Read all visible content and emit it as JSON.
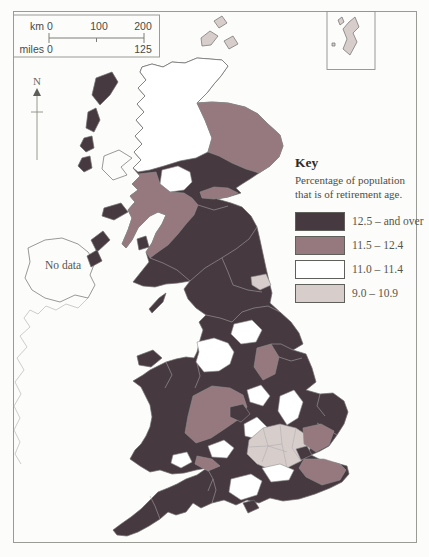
{
  "scale_bar": {
    "km_label": "km",
    "miles_label": "miles",
    "km_ticks": [
      "0",
      "100",
      "200"
    ],
    "miles_ticks": [
      "0",
      "125"
    ]
  },
  "north_arrow": {
    "label": "N"
  },
  "map": {
    "no_data_label": "No data",
    "outline_color": "#6d6d6d",
    "frame_color": "#9a9a97"
  },
  "key": {
    "title": "Key",
    "subtitle_line1": "Percentage of population",
    "subtitle_line2": "that is of retirement age.",
    "items": [
      {
        "label": "12.5 – and over",
        "color": "#473940"
      },
      {
        "label": "11.5 – 12.4",
        "color": "#96797e"
      },
      {
        "label": "11.0 – 11.4",
        "color": "#ffffff"
      },
      {
        "label": "9.0 – 10.9",
        "color": "#d7cecc"
      }
    ]
  }
}
